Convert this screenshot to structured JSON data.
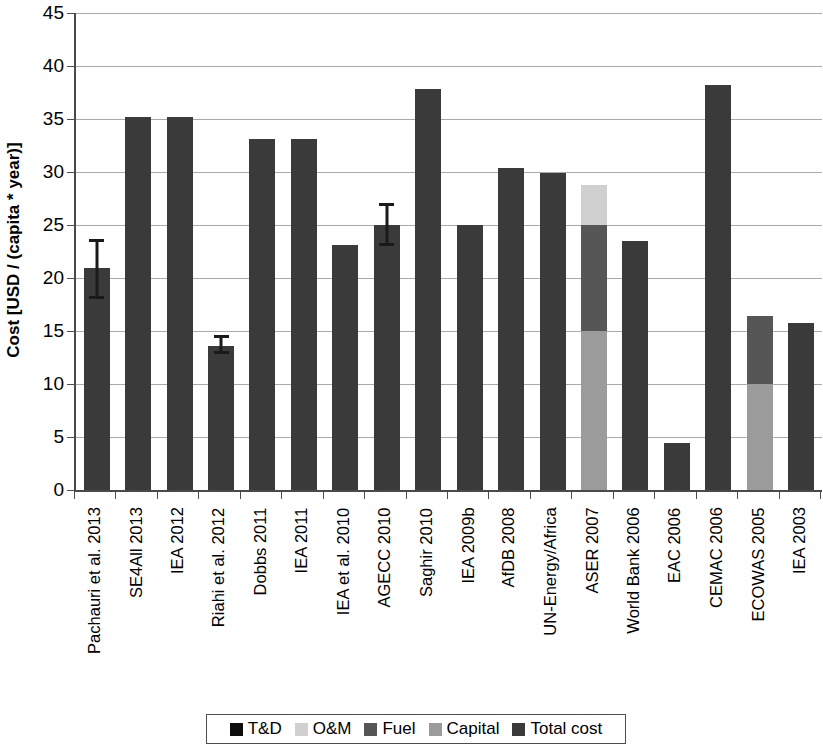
{
  "chart_data": {
    "type": "bar",
    "title": "",
    "subtitle": "",
    "xlabel": "",
    "ylabel": "Cost [USD / (capita * year)]",
    "ylim": [
      0,
      45
    ],
    "ytick_values": [
      0,
      5,
      10,
      15,
      20,
      25,
      30,
      35,
      40,
      45
    ],
    "ytick_labels": [
      "0",
      "5",
      "10",
      "15",
      "20",
      "25",
      "30",
      "35",
      "40",
      "45"
    ],
    "grid": true,
    "grid_axis": "y",
    "legend_position": "bottom",
    "stacked": true,
    "series": [
      {
        "name": "T&D",
        "color": "#0d0d0d"
      },
      {
        "name": "O&M",
        "color": "#d0d0d0"
      },
      {
        "name": "Fuel",
        "color": "#565656"
      },
      {
        "name": "Capital",
        "color": "#9b9b9b"
      },
      {
        "name": "Total cost",
        "color": "#3a3a3a"
      }
    ],
    "categories": [
      "Pachauri et al. 2013",
      "SE4All 2013",
      "IEA 2012",
      "Riahi et al. 2012",
      "Dobbs 2011",
      "IEA 2011",
      "IEA et al. 2010",
      "AGECC 2010",
      "Saghir 2010",
      "IEA 2009b",
      "AfDB 2008",
      "UN-Energy/Africa",
      "ASER 2007",
      "World Bank 2006",
      "EAC 2006",
      "CEMAC 2006",
      "ECOWAS 2005",
      "IEA 2003"
    ],
    "bars": [
      {
        "category": "Pachauri et al. 2013",
        "total": 20.9,
        "segments": [
          {
            "series": "Total cost",
            "value": 20.9
          }
        ],
        "error": {
          "low": 18.0,
          "high": 23.7
        }
      },
      {
        "category": "SE4All 2013",
        "total": 35.2,
        "segments": [
          {
            "series": "Total cost",
            "value": 35.2
          }
        ],
        "error": null
      },
      {
        "category": "IEA 2012",
        "total": 35.2,
        "segments": [
          {
            "series": "Total cost",
            "value": 35.2
          }
        ],
        "error": null
      },
      {
        "category": "Riahi et al. 2012",
        "total": 13.6,
        "segments": [
          {
            "series": "Total cost",
            "value": 13.6
          }
        ],
        "error": {
          "low": 12.8,
          "high": 14.6
        }
      },
      {
        "category": "Dobbs 2011",
        "total": 33.1,
        "segments": [
          {
            "series": "Total cost",
            "value": 33.1
          }
        ],
        "error": null
      },
      {
        "category": "IEA 2011",
        "total": 33.1,
        "segments": [
          {
            "series": "Total cost",
            "value": 33.1
          }
        ],
        "error": null
      },
      {
        "category": "IEA et al. 2010",
        "total": 23.1,
        "segments": [
          {
            "series": "Total cost",
            "value": 23.1
          }
        ],
        "error": null
      },
      {
        "category": "AGECC 2010",
        "total": 25.0,
        "segments": [
          {
            "series": "Total cost",
            "value": 25.0
          }
        ],
        "error": {
          "low": 23.0,
          "high": 27.1
        }
      },
      {
        "category": "Saghir 2010",
        "total": 37.8,
        "segments": [
          {
            "series": "Total cost",
            "value": 37.8
          }
        ],
        "error": null
      },
      {
        "category": "IEA 2009b",
        "total": 25.0,
        "segments": [
          {
            "series": "Total cost",
            "value": 25.0
          }
        ],
        "error": null
      },
      {
        "category": "AfDB 2008",
        "total": 30.4,
        "segments": [
          {
            "series": "Total cost",
            "value": 30.4
          }
        ],
        "error": null
      },
      {
        "category": "UN-Energy/Africa",
        "total": 29.9,
        "segments": [
          {
            "series": "Total cost",
            "value": 29.9
          }
        ],
        "error": null
      },
      {
        "category": "ASER 2007",
        "total": 28.8,
        "segments": [
          {
            "series": "Capital",
            "value": 15.0
          },
          {
            "series": "Fuel",
            "value": 10.0
          },
          {
            "series": "O&M",
            "value": 3.8
          }
        ],
        "error": null
      },
      {
        "category": "World Bank 2006",
        "total": 23.5,
        "segments": [
          {
            "series": "Total cost",
            "value": 23.5
          }
        ],
        "error": null
      },
      {
        "category": "EAC 2006",
        "total": 4.4,
        "segments": [
          {
            "series": "Total cost",
            "value": 4.4
          }
        ],
        "error": null
      },
      {
        "category": "CEMAC 2006",
        "total": 38.2,
        "segments": [
          {
            "series": "Total cost",
            "value": 38.2
          }
        ],
        "error": null
      },
      {
        "category": "ECOWAS 2005",
        "total": 16.4,
        "segments": [
          {
            "series": "Capital",
            "value": 10.0
          },
          {
            "series": "Fuel",
            "value": 6.4
          }
        ],
        "error": null
      },
      {
        "category": "IEA 2003",
        "total": 15.8,
        "segments": [
          {
            "series": "Total cost",
            "value": 15.8
          }
        ],
        "error": null
      }
    ]
  },
  "legend": {
    "entries": [
      {
        "label": "T&D",
        "color": "#0d0d0d"
      },
      {
        "label": "O&M",
        "color": "#d0d0d0"
      },
      {
        "label": "Fuel",
        "color": "#565656"
      },
      {
        "label": "Capital",
        "color": "#9b9b9b"
      },
      {
        "label": "Total cost",
        "color": "#3a3a3a"
      }
    ]
  },
  "axis": {
    "y_title": "Cost [USD / (capita * year)]"
  },
  "colors": {
    "gridline": "#a9a9a9",
    "axis": "#4a4a4a",
    "background": "#ffffff",
    "error_bar": "#1a1a1a"
  }
}
